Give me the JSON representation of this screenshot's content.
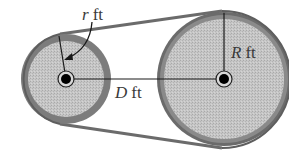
{
  "diagram": {
    "type": "belt-pulley",
    "labels": {
      "small_radius": {
        "var": "r",
        "unit": "ft"
      },
      "center_distance": {
        "var": "D",
        "unit": "ft"
      },
      "large_radius": {
        "var": "R",
        "unit": "ft"
      }
    },
    "colors": {
      "belt": "#6e6e6e",
      "rim": "#7a7a7a",
      "fill": "#c4c4c4",
      "line": "#1a1a1a",
      "hub": "#000000"
    }
  }
}
